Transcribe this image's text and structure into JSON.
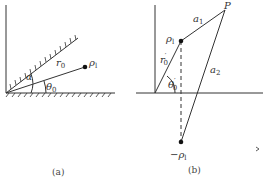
{
  "panel_a": {
    "caption": "(a)",
    "labels": {
      "alpha": "α",
      "theta": "θ",
      "theta_sub": "0",
      "r": "r",
      "r_sub": "0",
      "rho": "ρ",
      "rho_sub": "l"
    }
  },
  "panel_b": {
    "caption": "(b)",
    "labels": {
      "P": "P",
      "a1": "a",
      "a1_sub": "1",
      "a2": "a",
      "a2_sub": "2",
      "rho": "ρ",
      "rho_sub": "l",
      "r": "r",
      "r_sup": "′",
      "r_sub": "0",
      "theta": "θ",
      "theta_sup": "′",
      "theta_sub": "0",
      "neg_rho": "−ρ",
      "neg_rho_sub": "l"
    }
  },
  "colors": {
    "line": "#333333",
    "text": "#333333"
  }
}
